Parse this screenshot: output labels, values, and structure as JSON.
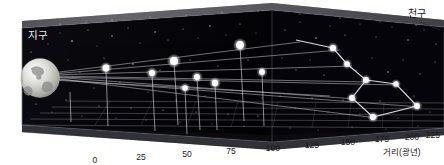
{
  "figure": {
    "kind": "3d-perspective-box-diagram",
    "background_color": "#ffffff",
    "box_fill_color": "#050508",
    "top_face_color": "#6a6a6e",
    "star_color": "#ffffff",
    "line_color": "#c8c8cc",
    "grid_color": "#8d8d93",
    "labels": {
      "earth": "지구",
      "celestial_sphere": "천구",
      "axis_title": "거리(광년)"
    }
  },
  "axis": {
    "title": "거리(광년)",
    "unit": "광년",
    "min": 0,
    "max": 225,
    "step": 25,
    "ticks": [
      {
        "label": "0",
        "value": 0,
        "x": 95,
        "y": 155
      },
      {
        "label": "25",
        "value": 25,
        "x": 141,
        "y": 152
      },
      {
        "label": "50",
        "value": 50,
        "x": 187,
        "y": 149
      },
      {
        "label": "75",
        "value": 75,
        "x": 231,
        "y": 146
      },
      {
        "label": "100",
        "value": 100,
        "x": 273,
        "y": 143
      },
      {
        "label": "125",
        "value": 125,
        "x": 312,
        "y": 140
      },
      {
        "label": "150",
        "value": 150,
        "x": 348,
        "y": 137
      },
      {
        "label": "175",
        "value": 175,
        "x": 382,
        "y": 134
      },
      {
        "label": "200",
        "value": 200,
        "x": 412,
        "y": 132
      },
      {
        "label": "225",
        "value": 225,
        "x": 433,
        "y": 130
      }
    ]
  },
  "annotations": [
    {
      "name": "earth-label",
      "text": "지구",
      "x": 30,
      "y": 33,
      "inside_box": true
    },
    {
      "name": "celestial-sphere-label",
      "text": "천구",
      "x": 417,
      "y": 12,
      "inside_box": false
    },
    {
      "name": "axis-title-label",
      "text": "거리(광년)",
      "x": 405,
      "y": 148,
      "inside_box": false
    }
  ],
  "chart_data": {
    "type": "scatter",
    "title": "",
    "xlabel": "거리(광년)",
    "ylabel": "",
    "xlim": [
      0,
      225
    ],
    "grid": true,
    "legend": "none",
    "description_labels": [
      "지구",
      "천구",
      "거리(광년)"
    ],
    "categories": [
      "Star 1",
      "Star 2",
      "Star 3",
      "Star 4",
      "Star 5",
      "Star 6",
      "Star 7"
    ],
    "series": [
      {
        "name": "Big Dipper stars (true distance)",
        "values": [
          78,
          81,
          84,
          81,
          83,
          105,
          124
        ]
      }
    ],
    "points": [
      {
        "name": "star-1",
        "distance_ly": 78,
        "sx": 106,
        "sy": 68,
        "fx": 110,
        "fy": 125
      },
      {
        "name": "star-2",
        "distance_ly": 81,
        "sx": 152,
        "sy": 73,
        "fx": 158,
        "fy": 132
      },
      {
        "name": "star-3",
        "distance_ly": 84,
        "sx": 174,
        "sy": 61,
        "fx": 181,
        "fy": 124
      },
      {
        "name": "star-4",
        "distance_ly": 81,
        "sx": 185,
        "sy": 88,
        "fx": 190,
        "fy": 137
      },
      {
        "name": "star-5",
        "distance_ly": 83,
        "sx": 197,
        "sy": 77,
        "fx": 202,
        "fy": 131
      },
      {
        "name": "star-6",
        "distance_ly": 105,
        "sx": 215,
        "sy": 83,
        "fx": 220,
        "fy": 129
      },
      {
        "name": "star-7",
        "distance_ly": 124,
        "sx": 240,
        "sy": 45,
        "fx": 246,
        "fy": 113
      },
      {
        "name": "star-8",
        "distance_ly": 138,
        "sx": 262,
        "sy": 72,
        "fx": 266,
        "fy": 118
      }
    ],
    "projected_constellation": {
      "name": "Big Dipper projection on celestial sphere",
      "nodes": [
        {
          "label": "A",
          "x": 333,
          "y": 48
        },
        {
          "label": "B",
          "x": 347,
          "y": 64
        },
        {
          "label": "C",
          "x": 366,
          "y": 80
        },
        {
          "label": "D",
          "x": 352,
          "y": 98
        },
        {
          "label": "E",
          "x": 373,
          "y": 117
        },
        {
          "label": "F",
          "x": 417,
          "y": 106
        },
        {
          "label": "G",
          "x": 396,
          "y": 84
        }
      ],
      "edges": [
        [
          "A",
          "B"
        ],
        [
          "B",
          "C"
        ],
        [
          "C",
          "D"
        ],
        [
          "D",
          "E"
        ],
        [
          "E",
          "F"
        ],
        [
          "F",
          "G"
        ],
        [
          "G",
          "C"
        ]
      ]
    },
    "earth": {
      "name": "earth-globe",
      "x": 40,
      "y": 77,
      "r": 20
    }
  }
}
